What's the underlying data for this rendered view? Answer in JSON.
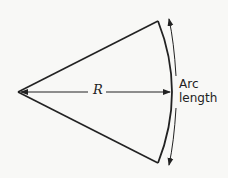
{
  "diagram": {
    "labels": {
      "radius": "R",
      "arc_line1": "Arc",
      "arc_line2": "length"
    },
    "colors": {
      "background": "#f8f8f6",
      "stroke": "#222222"
    }
  }
}
